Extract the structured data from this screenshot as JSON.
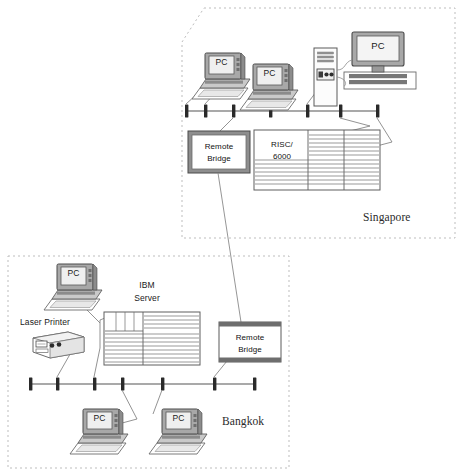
{
  "diagram": {
    "colors": {
      "line": "#4a4a4a",
      "region_border": "#b8b8b8",
      "device_fill": "#f2f2f2",
      "device_dark": "#6e6e6e",
      "screen_fill": "#d9d9d9",
      "text": "#1a1a1a"
    },
    "regions": [
      {
        "id": "singapore",
        "label": "Singapore",
        "border_style": "dashed"
      },
      {
        "id": "bangkok",
        "label": "Bangkok",
        "border_style": "dashed"
      }
    ],
    "singapore": {
      "site_label": "Singapore",
      "nodes": [
        {
          "name": "pc-1",
          "label": "PC",
          "type": "desktop-pc"
        },
        {
          "name": "pc-2",
          "label": "PC",
          "type": "desktop-pc"
        },
        {
          "name": "tower-pc",
          "label": "",
          "type": "tower-pc"
        },
        {
          "name": "pc-3",
          "label": "PC",
          "type": "monitor-on-case"
        },
        {
          "name": "remote-bridge",
          "label_line1": "Remote",
          "label_line2": "Bridge",
          "type": "bridge"
        },
        {
          "name": "risc-server",
          "label_line1": "RISC/",
          "label_line2": "6000",
          "type": "server"
        }
      ],
      "bus": {
        "name": "ethernet-bus",
        "tap_count": 7
      }
    },
    "bangkok": {
      "site_label": "Bangkok",
      "nodes": [
        {
          "name": "pc-4",
          "label": "PC",
          "type": "desktop-pc"
        },
        {
          "name": "laser-printer",
          "label": "Laser Printer",
          "type": "printer"
        },
        {
          "name": "ibm-server",
          "label_line1": "IBM",
          "label_line2": "Server",
          "type": "server"
        },
        {
          "name": "remote-bridge",
          "label_line1": "Remote",
          "label_line2": "Bridge",
          "type": "bridge"
        },
        {
          "name": "pc-5",
          "label": "PC",
          "type": "desktop-pc"
        },
        {
          "name": "pc-6",
          "label": "PC",
          "type": "desktop-pc"
        }
      ],
      "bus": {
        "name": "ethernet-bus",
        "tap_count": 7
      }
    },
    "wan_link": {
      "name": "wan-link",
      "from": "singapore-remote-bridge",
      "to": "bangkok-remote-bridge"
    }
  }
}
